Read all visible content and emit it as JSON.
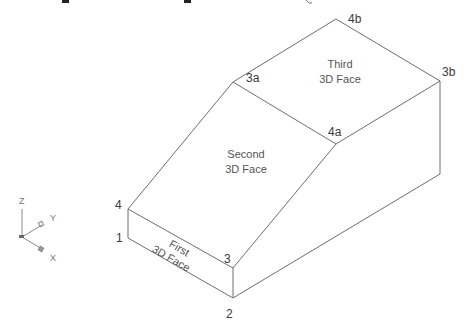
{
  "diagram": {
    "type": "isometric-3dface-wireframe",
    "colors": {
      "background": "#ffffff",
      "edge": "#6e6e6e",
      "label": "#3a3a3a",
      "ucs": "#8a8a8a"
    },
    "vertices": {
      "v1": {
        "label": "1",
        "x": 128,
        "y": 238
      },
      "v2": {
        "label": "2",
        "x": 233,
        "y": 298
      },
      "v3": {
        "label": "3",
        "x": 233,
        "y": 268
      },
      "v4": {
        "label": "4",
        "x": 128,
        "y": 209
      },
      "v3a": {
        "label": "3a",
        "x": 233,
        "y": 82
      },
      "v4a": {
        "label": "4a",
        "x": 336,
        "y": 144
      },
      "v4b": {
        "label": "4b",
        "x": 336,
        "y": 19
      },
      "v3b": {
        "label": "3b",
        "x": 440,
        "y": 81
      },
      "vbr": {
        "label": "",
        "x": 440,
        "y": 174
      }
    },
    "faces": [
      {
        "name": "first",
        "line1": "First",
        "line2": "3D Face"
      },
      {
        "name": "second",
        "line1": "Second",
        "line2": "3D Face"
      },
      {
        "name": "third",
        "line1": "Third",
        "line2": "3D Face"
      }
    ],
    "ucs_icon": {
      "z_label": "Z",
      "y_label": "Y",
      "x_label": "X"
    }
  }
}
